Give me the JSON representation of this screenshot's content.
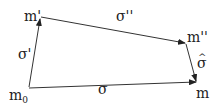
{
  "diagram": {
    "nodes": {
      "m0": {
        "label": "m",
        "sub": "0"
      },
      "m_prime": {
        "label": "m'"
      },
      "m_dprime": {
        "label": "m''"
      },
      "m": {
        "label": "m"
      }
    },
    "edges": {
      "sigma_prime": {
        "label": "σ'",
        "from": "m0",
        "to": "m_prime"
      },
      "sigma_dprime": {
        "label": "σ''",
        "from": "m_prime",
        "to": "m_dprime"
      },
      "sigma_hat": {
        "label": "σ̂",
        "hat": "^",
        "base": "σ",
        "from": "m_dprime",
        "to": "m"
      },
      "sigma": {
        "label": "σ",
        "from": "m0",
        "to": "m"
      }
    },
    "colors": {
      "line": "#333333",
      "text": "#222222",
      "background": "#ffffff"
    }
  }
}
